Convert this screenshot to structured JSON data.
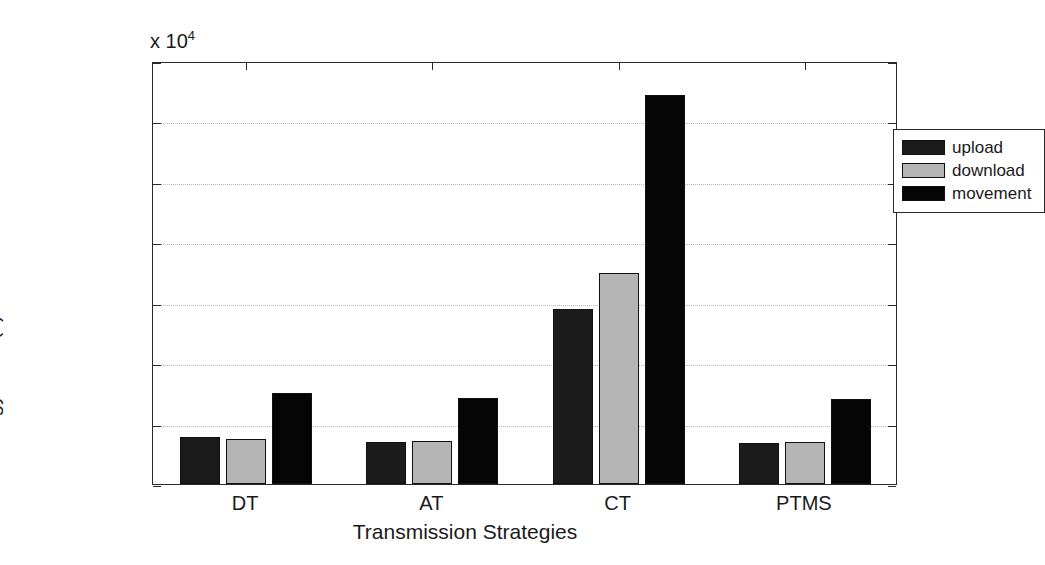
{
  "chart_data": {
    "type": "bar",
    "title": "",
    "xlabel": "Transmission Strategies",
    "ylabel": "Energy Cost (J)",
    "y_multiplier_text": "x 10",
    "y_multiplier_exponent": "4",
    "categories": [
      "DT",
      "AT",
      "CT",
      "PTMS"
    ],
    "ylim": [
      0,
      35000
    ],
    "ytick_labels": [
      "0",
      "0.5",
      "1",
      "1.5",
      "2",
      "2.5",
      "3",
      "3.5"
    ],
    "ytick_values": [
      0,
      5000,
      10000,
      15000,
      20000,
      25000,
      30000,
      35000
    ],
    "grid": true,
    "legend_position": "top-right",
    "series": [
      {
        "name": "upload",
        "color": "#1b1b1b",
        "values": [
          3900,
          3500,
          14500,
          3400
        ]
      },
      {
        "name": "download",
        "color": "#b5b5b5",
        "values": [
          3700,
          3600,
          17500,
          3500
        ]
      },
      {
        "name": "movement",
        "color": "#050505",
        "values": [
          7500,
          7100,
          32200,
          7000
        ]
      }
    ]
  },
  "legend": {
    "entries": [
      {
        "label": "upload"
      },
      {
        "label": "download"
      },
      {
        "label": "movement"
      }
    ]
  },
  "axes": {
    "y_label": "Energy Cost (J)",
    "x_label": "Transmission Strategies"
  }
}
